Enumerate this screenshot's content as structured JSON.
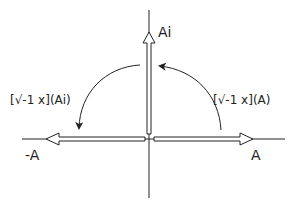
{
  "diagram": {
    "type": "complex-plane rotation",
    "axes": {
      "horizontal": "real axis",
      "vertical": "imaginary axis"
    },
    "vectors": [
      {
        "id": "A",
        "label": "A",
        "direction": "right"
      },
      {
        "id": "Ai",
        "label": "Ai",
        "direction": "up"
      },
      {
        "id": "neg-A",
        "label": "-A",
        "direction": "left"
      }
    ],
    "rotations": [
      {
        "id": "rot-A-to-Ai",
        "label": "[√-1 x](A)",
        "from": "A",
        "to": "Ai"
      },
      {
        "id": "rot-Ai-to-negA",
        "label": "[√-1 x](Ai)",
        "from": "Ai",
        "to": "-A"
      }
    ],
    "colors": {
      "stroke": "#222222",
      "background": "#ffffff"
    }
  }
}
